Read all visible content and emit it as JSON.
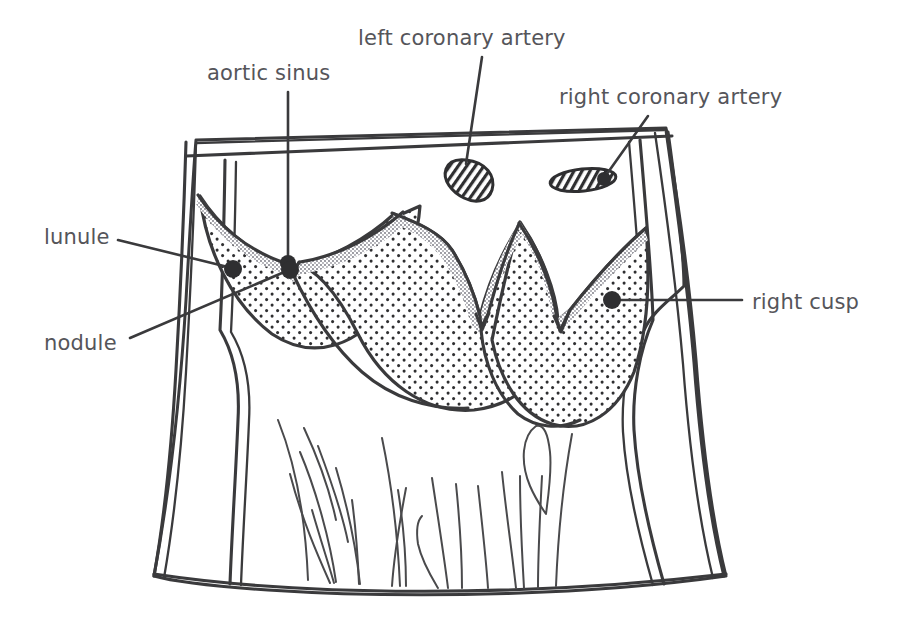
{
  "figure": {
    "background_color": "#ffffff",
    "ink_color": "#3a3a3c",
    "label_color": "#55555a",
    "stipple_color": "#2f2f31",
    "lunule_color": "#8d8d90"
  },
  "labels": [
    {
      "id": "aortic-sinus",
      "text": "aortic sinus",
      "text_x": 207,
      "text_y": 80,
      "anchor": "start",
      "leader": "M 288 92 L 288 262",
      "dot_x": 288,
      "dot_y": 263,
      "dot_r": 8
    },
    {
      "id": "left-coronary-artery",
      "text": "left coronary artery",
      "text_x": 358,
      "text_y": 45,
      "anchor": "start",
      "leader": "M 482 57 L 466 164",
      "dot_x": 0,
      "dot_y": 0,
      "dot_r": 0
    },
    {
      "id": "right-coronary-artery",
      "text": "right coronary artery",
      "text_x": 559,
      "text_y": 104,
      "anchor": "start",
      "leader": "M 648 116 L 604 178",
      "dot_x": 604,
      "dot_y": 179,
      "dot_r": 7
    },
    {
      "id": "lunule",
      "text": "lunule",
      "text_x": 44,
      "text_y": 244,
      "anchor": "start",
      "leader": "M 118 240 L 232 268",
      "dot_x": 233,
      "dot_y": 269,
      "dot_r": 9
    },
    {
      "id": "nodule",
      "text": "nodule",
      "text_x": 44,
      "text_y": 350,
      "anchor": "start",
      "leader": "M 130 338 L 289 270",
      "dot_x": 290,
      "dot_y": 270,
      "dot_r": 9
    },
    {
      "id": "right-cusp",
      "text": "right cusp",
      "text_x": 752,
      "text_y": 309,
      "anchor": "start",
      "leader": "M 742 300 L 613 300",
      "dot_x": 612,
      "dot_y": 300,
      "dot_r": 9
    }
  ],
  "structures": {
    "aorta_cut_rim": "double-line cut edge of ascending aorta",
    "left_wall": "aortic / ventricular wall, left",
    "right_wall": "aortic / ventricular wall, right",
    "cusps": [
      {
        "id": "left-cusp",
        "name": "left cusp"
      },
      {
        "id": "posterior-cusp",
        "name": "posterior (non-coronary) cusp"
      },
      {
        "id": "right-cusp",
        "name": "right cusp"
      }
    ],
    "ostia": [
      {
        "id": "left-coronary-ostium",
        "shape": "teardrop",
        "cx": 466,
        "cy": 179
      },
      {
        "id": "right-coronary-ostium",
        "shape": "flat-ellipse",
        "cx": 583,
        "cy": 180
      }
    ],
    "trabeculae": "trabeculae carneae of the left ventricle floor"
  }
}
